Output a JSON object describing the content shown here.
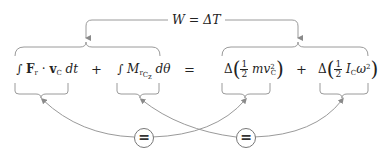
{
  "diagram": {
    "top_label": "W = ΔT",
    "terms": [
      {
        "id": "translational-work",
        "text": "∫ F_r · v_C dt"
      },
      {
        "id": "rotational-work",
        "text": "∫ M_{r,C_z} dθ"
      },
      {
        "id": "translational-ke-change",
        "text": "Δ(½ m v_C²)"
      },
      {
        "id": "rotational-ke-change",
        "text": "Δ(½ I_C ω²)"
      }
    ],
    "operators": [
      "+",
      "=",
      "+"
    ],
    "equivalence_markers": [
      "=",
      "="
    ],
    "line_color": "#9a9a9a"
  }
}
